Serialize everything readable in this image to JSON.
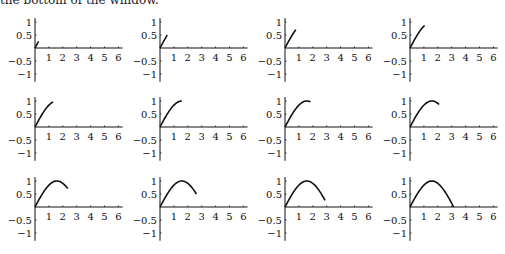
{
  "caption_fragment": "the bottom of the window.",
  "chart_data": {
    "type": "line",
    "title": "",
    "function": "sin(x)",
    "layout": {
      "rows": 3,
      "cols": 4
    },
    "xlabel": "",
    "ylabel": "",
    "xlim": [
      0,
      6.3
    ],
    "ylim": [
      -1,
      1
    ],
    "x_ticks": [
      "1",
      "2",
      "3",
      "4",
      "5",
      "6"
    ],
    "y_ticks": [
      "1",
      "0.5",
      "-0.5",
      "-1"
    ],
    "y_tick_values": [
      1,
      0.5,
      -0.5,
      -1
    ],
    "grid": false,
    "legend": null,
    "panels": [
      {
        "t_end": 0.2618
      },
      {
        "t_end": 0.5236
      },
      {
        "t_end": 0.7854
      },
      {
        "t_end": 1.0472
      },
      {
        "t_end": 1.309
      },
      {
        "t_end": 1.5708
      },
      {
        "t_end": 1.8326
      },
      {
        "t_end": 2.0944
      },
      {
        "t_end": 2.3562
      },
      {
        "t_end": 2.618
      },
      {
        "t_end": 2.8798
      },
      {
        "t_end": 3.1416
      }
    ],
    "line_color": "#111111"
  },
  "geometry": {
    "col_origin_x": [
      35,
      160,
      285,
      410
    ],
    "row_axis_y": [
      48,
      127,
      207
    ],
    "px_per_x": 13.9,
    "px_per_y": 26
  }
}
